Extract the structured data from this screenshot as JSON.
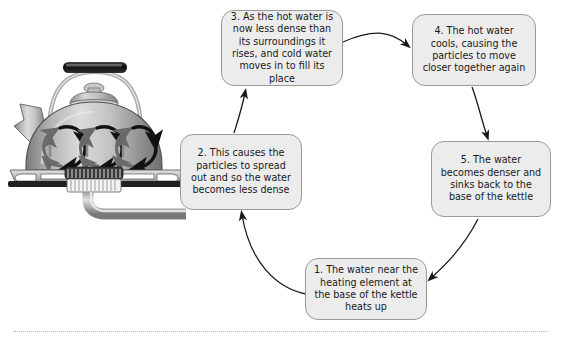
{
  "diagram": {
    "background_color": "#ffffff",
    "node_fill": "#ececec",
    "node_border": "#9a9a9a",
    "arrow_color": "#1a1a1a",
    "nodes": [
      {
        "id": "1",
        "name": "water-near-heating-element",
        "text": "1. The water near the heating element at the base of the kettle heats up"
      },
      {
        "id": "2",
        "name": "particles-spread-out",
        "text": "2. This causes the particles to spread out and so the water becomes less dense"
      },
      {
        "id": "3",
        "name": "hot-water-rises",
        "text": "3. As the hot water is now less dense than its surroundings it rises, and cold water moves in to fill its place"
      },
      {
        "id": "4",
        "name": "hot-water-cools",
        "text": "4. The hot water cools, causing the particles to move closer together again"
      },
      {
        "id": "5",
        "name": "water-sinks-back",
        "text": "5. The water becomes denser and sinks back to the base of the kettle"
      }
    ],
    "edges": [
      {
        "from": "1",
        "to": "2",
        "name": "edge-1-to-2"
      },
      {
        "from": "2",
        "to": "3",
        "name": "edge-2-to-3"
      },
      {
        "from": "3",
        "to": "4",
        "name": "edge-3-to-4"
      },
      {
        "from": "4",
        "to": "5",
        "name": "edge-4-to-5"
      },
      {
        "from": "5",
        "to": "1",
        "name": "edge-5-to-1"
      }
    ]
  },
  "illustration": {
    "name": "kettle-on-gas-hob",
    "description": "Greyscale drawing of a metal kettle with black handle grip sitting on a gas burner, with curved convection current arrows circulating inside the kettle body",
    "colors": {
      "body_light": "#d9d9d9",
      "body_mid": "#a9a9a9",
      "body_dark": "#6f6f6f",
      "handle_grip": "#151515",
      "hob_dark": "#2b2b2b"
    }
  }
}
